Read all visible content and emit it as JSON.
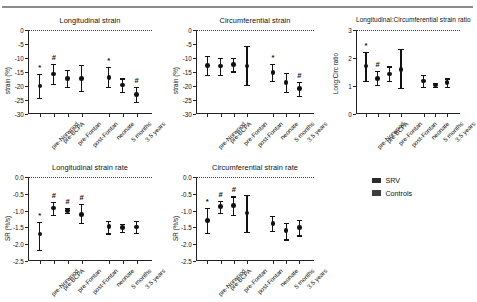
{
  "legend": {
    "items": [
      {
        "label": "SRV",
        "color": "#2b2b2b"
      },
      {
        "label": "Controls",
        "color": "#3d3d3d"
      }
    ]
  },
  "groups": {
    "srv": [
      "pre-Norwood",
      "pre-BCPA",
      "pre-Fontan",
      "post-Fontan"
    ],
    "controls": [
      "neonate",
      "5 months",
      "3.5 years"
    ]
  },
  "chart_data": [
    {
      "type": "scatter",
      "id": "longitudinal-strain",
      "title": "Longitudinal strain",
      "xlabel": "",
      "ylabel": "strain (%)",
      "ylim": [
        -30,
        0
      ],
      "yticks": [
        0,
        -5,
        -10,
        -15,
        -20,
        -25,
        -30
      ],
      "ytick_labels": [
        "0",
        "-5",
        "-10",
        "-15",
        "-20",
        "-25",
        "-30"
      ],
      "grid": false,
      "zero_reference": 0,
      "categories": [
        "pre-Norwood",
        "pre-BCPA",
        "pre-Fontan",
        "post-Fontan",
        "neonate",
        "5 months",
        "3.5 years"
      ],
      "values": [
        -20.0,
        -15.7,
        -17.4,
        -17.4,
        -16.9,
        -19.7,
        -23.1
      ],
      "err_low": [
        -24.3,
        -19.2,
        -20.4,
        -21.8,
        -20.4,
        -22.1,
        -25.8
      ],
      "err_high": [
        -15.8,
        -12.1,
        -14.2,
        -12.6,
        -13.2,
        -17.3,
        -20.4
      ],
      "annotations": [
        "*",
        "#",
        "",
        "",
        "*",
        "",
        "#"
      ]
    },
    {
      "type": "scatter",
      "id": "circumferential-strain",
      "title": "Circumferential strain",
      "xlabel": "",
      "ylabel": "strain (%)",
      "ylim": [
        -30,
        0
      ],
      "yticks": [
        0,
        -5,
        -10,
        -15,
        -20,
        -25,
        -30
      ],
      "ytick_labels": [
        "0",
        "-5",
        "-10",
        "-15",
        "-20",
        "-25",
        "-30"
      ],
      "grid": false,
      "zero_reference": 0,
      "categories": [
        "pre-Norwood",
        "pre-BCPA",
        "pre-Fontan",
        "post-Fontan",
        "neonate",
        "5 months",
        "3.5 years"
      ],
      "values": [
        -12.6,
        -12.9,
        -12.3,
        -12.8,
        -15.1,
        -18.7,
        -20.9
      ],
      "err_low": [
        -16.2,
        -16.0,
        -14.8,
        -19.7,
        -18.2,
        -22.2,
        -23.5
      ],
      "err_high": [
        -9.3,
        -9.9,
        -9.9,
        -5.6,
        -12.1,
        -15.2,
        -18.4
      ],
      "annotations": [
        "",
        "",
        "",
        "",
        "*",
        "",
        "#"
      ]
    },
    {
      "type": "scatter",
      "id": "long-circ-strain-ratio",
      "title": "Longitudinal:Circumferential strain ratio",
      "xlabel": "",
      "ylabel": "Long:Circ ratio",
      "ylim": [
        0,
        3
      ],
      "yticks": [
        3,
        2,
        1,
        0
      ],
      "ytick_labels": [
        "3",
        "2",
        "1",
        "0"
      ],
      "grid": false,
      "zero_reference": 3,
      "categories": [
        "pre-Norwood",
        "pre-BCPA",
        "pre-Fontan",
        "post-Fontan",
        "neonate",
        "5 months",
        "3.5 years"
      ],
      "values": [
        1.72,
        1.27,
        1.43,
        1.58,
        1.18,
        1.03,
        1.12
      ],
      "err_low": [
        1.17,
        1.03,
        1.17,
        0.92,
        0.95,
        0.96,
        0.98
      ],
      "err_high": [
        2.22,
        1.53,
        1.7,
        2.33,
        1.4,
        1.12,
        1.27
      ],
      "annotations": [
        "*",
        "#",
        "",
        "",
        "",
        "",
        ""
      ]
    },
    {
      "type": "scatter",
      "id": "longitudinal-strain-rate",
      "title": "Longitudinal strain rate",
      "xlabel": "",
      "ylabel": "SR (%/s)",
      "ylim": [
        -2.5,
        0
      ],
      "yticks": [
        0,
        -0.5,
        -1.0,
        -1.5,
        -2.0,
        -2.5
      ],
      "ytick_labels": [
        "0.0",
        "-0.5",
        "-1.0",
        "-1.5",
        "-2.0",
        "-2.5"
      ],
      "grid": false,
      "zero_reference": 0,
      "categories": [
        "pre-Norwood",
        "pre-BCPA",
        "pre-Fontan",
        "post-Fontan",
        "neonate",
        "5 months",
        "3.5 years"
      ],
      "values": [
        -1.7,
        -0.92,
        -1.0,
        -1.11,
        -1.47,
        -1.51,
        -1.49
      ],
      "err_low": [
        -2.16,
        -1.14,
        -1.08,
        -1.38,
        -1.68,
        -1.63,
        -1.67
      ],
      "err_high": [
        -1.34,
        -0.74,
        -0.92,
        -0.8,
        -1.3,
        -1.39,
        -1.32
      ],
      "annotations": [
        "*",
        "#",
        "#",
        "#",
        "",
        "",
        ""
      ]
    },
    {
      "type": "scatter",
      "id": "circumferential-strain-rate",
      "title": "Circumferential strain rate",
      "xlabel": "",
      "ylabel": "SR (%/s)",
      "ylim": [
        -2.5,
        0
      ],
      "yticks": [
        0,
        -0.5,
        -1.0,
        -1.5,
        -2.0,
        -2.5
      ],
      "ytick_labels": [
        "0.0",
        "-0.5",
        "-1.0",
        "-1.5",
        "-2.0",
        "-2.5"
      ],
      "grid": false,
      "zero_reference": 0,
      "categories": [
        "pre-Norwood",
        "pre-BCPA",
        "pre-Fontan",
        "post-Fontan",
        "neonate",
        "5 months",
        "3.5 years"
      ],
      "values": [
        -1.3,
        -0.87,
        -0.84,
        -1.07,
        -1.38,
        -1.6,
        -1.51
      ],
      "err_low": [
        -1.67,
        -1.06,
        -1.13,
        -1.64,
        -1.6,
        -1.86,
        -1.74
      ],
      "err_high": [
        -0.93,
        -0.7,
        -0.58,
        -0.53,
        -1.17,
        -1.36,
        -1.28
      ],
      "annotations": [
        "*",
        "#",
        "#",
        "",
        "",
        "",
        ""
      ]
    }
  ]
}
